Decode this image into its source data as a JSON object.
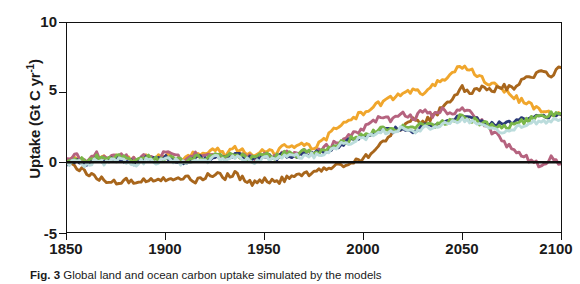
{
  "figure": {
    "caption_label": "Fig. 3",
    "caption_text": " Global land and ocean carbon uptake simulated by the models"
  },
  "axes": {
    "ylabel_prefix": "Uptake (Gt C yr",
    "ylabel_exponent": "-1",
    "ylabel_suffix": ")",
    "xticks": [
      "1850",
      "1900",
      "1950",
      "2000",
      "2050",
      "2100"
    ],
    "yticks": [
      "10",
      "5",
      "0",
      "-5"
    ]
  },
  "chart_data": {
    "type": "line",
    "title": "",
    "xlabel": "",
    "ylabel": "Uptake (Gt C yr-1)",
    "xlim": [
      1850,
      2100
    ],
    "ylim": [
      -5,
      10
    ],
    "grid": false,
    "legend": "none",
    "zero_line": 0,
    "x": [
      1850,
      1855,
      1860,
      1865,
      1870,
      1875,
      1880,
      1885,
      1890,
      1895,
      1900,
      1905,
      1910,
      1915,
      1920,
      1925,
      1930,
      1935,
      1940,
      1945,
      1950,
      1955,
      1960,
      1965,
      1970,
      1975,
      1980,
      1985,
      1990,
      1995,
      2000,
      2005,
      2010,
      2015,
      2020,
      2025,
      2030,
      2035,
      2040,
      2045,
      2050,
      2055,
      2060,
      2065,
      2070,
      2075,
      2080,
      2085,
      2090,
      2095,
      2100
    ],
    "series": [
      {
        "name": "amber",
        "color": "#F0A62C",
        "values": [
          0.1,
          0.35,
          0.05,
          0.45,
          0.2,
          0.55,
          0.3,
          0.15,
          0.5,
          0.25,
          0.6,
          0.35,
          0.2,
          0.7,
          0.45,
          0.9,
          0.6,
          1.0,
          0.75,
          0.5,
          0.95,
          0.7,
          1.15,
          0.95,
          1.3,
          1.05,
          1.55,
          2.3,
          2.9,
          3.2,
          3.55,
          3.9,
          4.4,
          4.6,
          4.9,
          5.2,
          5.0,
          5.6,
          6.0,
          6.4,
          6.9,
          6.5,
          6.0,
          5.6,
          5.2,
          4.8,
          4.4,
          4.1,
          3.8,
          3.6,
          3.4
        ]
      },
      {
        "name": "sienna",
        "color": "#A8661C",
        "values": [
          -0.05,
          -0.3,
          -0.7,
          -1.1,
          -1.3,
          -1.5,
          -1.35,
          -1.5,
          -1.2,
          -1.4,
          -1.15,
          -1.35,
          -1.1,
          -1.3,
          -1.05,
          -0.85,
          -1.05,
          -0.8,
          -1.3,
          -1.5,
          -1.2,
          -1.45,
          -1.2,
          -1.05,
          -0.85,
          -0.7,
          -0.55,
          -0.35,
          -0.2,
          0.0,
          0.25,
          0.8,
          1.5,
          2.2,
          2.6,
          3.0,
          2.8,
          3.3,
          3.9,
          4.6,
          5.3,
          5.0,
          5.4,
          5.1,
          5.5,
          5.3,
          5.8,
          6.2,
          6.5,
          6.3,
          6.8
        ]
      },
      {
        "name": "mauve",
        "color": "#B5637F",
        "values": [
          0.15,
          0.5,
          0.1,
          0.6,
          0.25,
          0.7,
          0.4,
          0.2,
          0.55,
          0.3,
          0.65,
          0.4,
          0.15,
          0.55,
          0.3,
          0.6,
          0.35,
          0.7,
          0.45,
          0.25,
          0.6,
          0.4,
          0.7,
          0.5,
          0.85,
          0.6,
          1.0,
          1.35,
          1.7,
          2.1,
          2.4,
          2.9,
          3.3,
          3.0,
          3.6,
          3.1,
          3.7,
          3.3,
          3.8,
          3.5,
          4.0,
          3.4,
          2.9,
          2.2,
          1.6,
          1.0,
          0.5,
          0.1,
          -0.3,
          0.3,
          -0.1
        ]
      },
      {
        "name": "navy",
        "color": "#2B3A78",
        "values": [
          0.0,
          0.2,
          -0.05,
          0.25,
          0.05,
          0.3,
          0.1,
          0.0,
          0.25,
          0.1,
          0.3,
          0.15,
          0.0,
          0.35,
          0.2,
          0.45,
          0.3,
          0.5,
          0.35,
          0.2,
          0.45,
          0.3,
          0.55,
          0.45,
          0.65,
          0.55,
          0.8,
          1.1,
          1.4,
          1.6,
          1.85,
          2.1,
          2.35,
          2.25,
          2.55,
          2.3,
          2.6,
          2.5,
          2.8,
          3.0,
          3.3,
          3.1,
          2.9,
          2.75,
          2.85,
          2.95,
          3.1,
          3.2,
          3.3,
          3.4,
          3.45
        ]
      },
      {
        "name": "green",
        "color": "#7AB648",
        "values": [
          0.05,
          0.3,
          0.0,
          0.35,
          0.15,
          0.45,
          0.2,
          0.1,
          0.35,
          0.2,
          0.4,
          0.25,
          0.1,
          0.45,
          0.3,
          0.55,
          0.35,
          0.6,
          0.4,
          0.25,
          0.55,
          0.35,
          0.6,
          0.5,
          0.75,
          0.6,
          0.9,
          1.2,
          1.5,
          1.7,
          1.95,
          2.2,
          2.45,
          2.3,
          2.6,
          2.4,
          2.7,
          2.6,
          2.85,
          3.05,
          3.3,
          3.05,
          2.8,
          2.6,
          2.5,
          2.7,
          2.9,
          3.1,
          3.3,
          3.45,
          3.5
        ]
      },
      {
        "name": "cyan",
        "color": "#BBDCDC",
        "values": [
          -0.1,
          0.1,
          -0.2,
          0.15,
          -0.05,
          0.2,
          0.0,
          -0.1,
          0.15,
          0.0,
          0.2,
          0.05,
          -0.1,
          0.25,
          0.1,
          0.35,
          0.2,
          0.4,
          0.25,
          0.1,
          0.35,
          0.2,
          0.45,
          0.35,
          0.55,
          0.45,
          0.7,
          1.0,
          1.3,
          1.5,
          1.75,
          2.0,
          2.25,
          2.15,
          2.45,
          2.2,
          2.5,
          2.4,
          2.7,
          2.9,
          3.15,
          2.9,
          2.6,
          2.4,
          2.25,
          2.4,
          2.6,
          2.8,
          2.95,
          3.05,
          3.1
        ]
      }
    ]
  }
}
